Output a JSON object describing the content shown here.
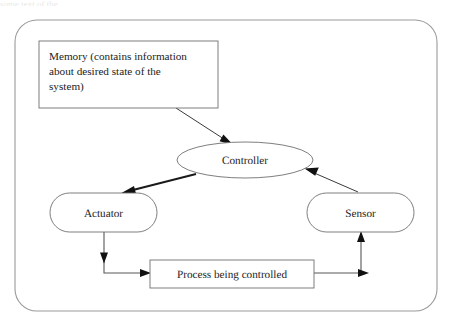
{
  "figure": {
    "caption_sliver": "some text of the",
    "frame": {
      "x": 15,
      "y": 20,
      "width": 422,
      "height": 291,
      "radius": 22
    }
  },
  "nodes": {
    "memory": {
      "name": "memory-box",
      "shape": "rectangle",
      "lines": [
        "Memory (contains information",
        "about desired state of the",
        "system)"
      ],
      "x": 39,
      "y": 41,
      "width": 179,
      "height": 67
    },
    "controller": {
      "name": "controller-ellipse",
      "shape": "ellipse",
      "label": "Controller",
      "cx": 245,
      "cy": 160,
      "rx": 68,
      "ry": 18
    },
    "actuator": {
      "name": "actuator-box",
      "shape": "stadium",
      "label": "Actuator",
      "x": 50,
      "y": 193,
      "width": 107,
      "height": 39
    },
    "sensor": {
      "name": "sensor-box",
      "shape": "stadium",
      "label": "Sensor",
      "x": 307,
      "y": 193,
      "width": 107,
      "height": 39
    },
    "process": {
      "name": "process-box",
      "shape": "rectangle",
      "label": "Process being controlled",
      "x": 150,
      "y": 260,
      "width": 164,
      "height": 28
    }
  },
  "edges": [
    {
      "name": "memory-to-controller",
      "from": "memory",
      "to": "controller",
      "style": "thin-diagonal"
    },
    {
      "name": "controller-to-actuator",
      "from": "controller",
      "to": "actuator",
      "style": "thick-diagonal"
    },
    {
      "name": "actuator-to-process",
      "from": "actuator",
      "to": "process",
      "style": "elbow-down-right"
    },
    {
      "name": "process-to-sensor",
      "from": "process",
      "to": "sensor",
      "style": "elbow-right-up"
    },
    {
      "name": "sensor-to-controller",
      "from": "sensor",
      "to": "controller",
      "style": "thin-diagonal"
    }
  ],
  "colors": {
    "shape_stroke": "#6f6f6f",
    "frame_stroke": "#9a9a9a",
    "arrow_dark": "#111111",
    "text": "#1c1c1c",
    "background": "#ffffff"
  }
}
